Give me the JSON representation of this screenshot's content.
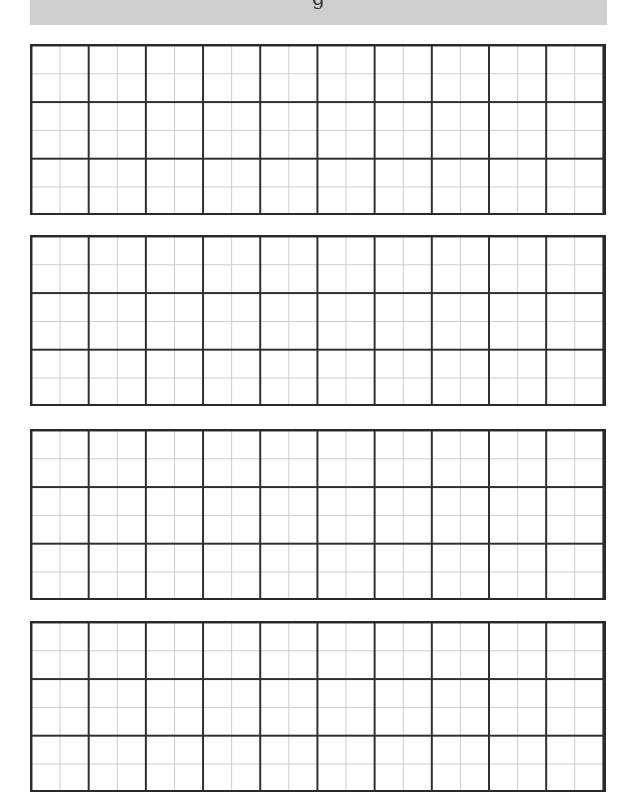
{
  "header": {
    "title": "g",
    "background": "#cfcfcf"
  },
  "worksheet": {
    "type": "grid-paper",
    "block_count": 4,
    "blocks": [
      {
        "id": 1,
        "columns": 10,
        "rows": 3,
        "subdivisions": 2
      },
      {
        "id": 2,
        "columns": 10,
        "rows": 3,
        "subdivisions": 2
      },
      {
        "id": 3,
        "columns": 10,
        "rows": 3,
        "subdivisions": 2
      },
      {
        "id": 4,
        "columns": 10,
        "rows": 3,
        "subdivisions": 2
      }
    ],
    "colors": {
      "border": "#2a2a2a",
      "major_line": "#2f2f2f",
      "minor_line": "#cccccc"
    }
  }
}
